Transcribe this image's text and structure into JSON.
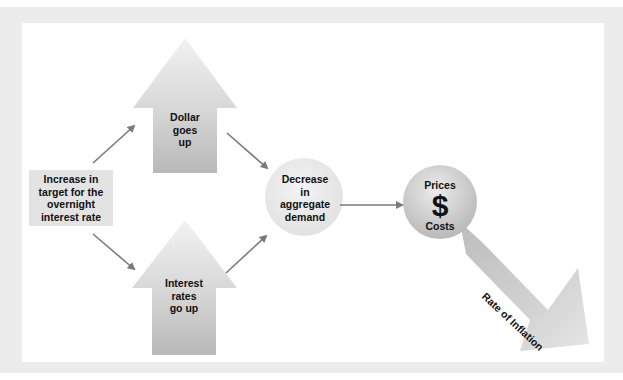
{
  "diagram": {
    "start_box": {
      "label": "Increase in target for the overnight interest rate",
      "lines": [
        "Increase in",
        "target for the",
        "overnight",
        "interest rate"
      ]
    },
    "upper_arrow": {
      "lines": [
        "Dollar",
        "goes",
        "up"
      ]
    },
    "lower_arrow": {
      "lines": [
        "Interest",
        "rates",
        "go up"
      ]
    },
    "demand_circle": {
      "lines": [
        "Decrease",
        "in",
        "aggregate",
        "demand"
      ]
    },
    "prices_circle": {
      "top": "Prices",
      "symbol": "$",
      "bottom": "Costs"
    },
    "inflation_arrow": {
      "label": "Rate of Inflation"
    },
    "colors": {
      "frame": "#ececec",
      "box": "#e3e3e3",
      "connector": "#7a7a7a",
      "shape_light": "#f0f0f0",
      "shape_dark": "#b5b5b5"
    }
  }
}
